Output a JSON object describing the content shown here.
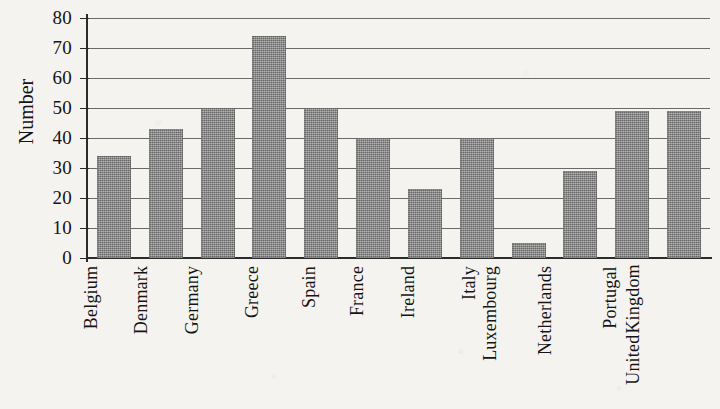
{
  "chart_data": {
    "type": "bar",
    "title": "",
    "xlabel": "",
    "ylabel": "Number",
    "ylim": [
      0,
      80
    ],
    "ytick_step": 10,
    "yticks": [
      80,
      70,
      60,
      50,
      40,
      30,
      20,
      10,
      0
    ],
    "grid": true,
    "legend": "none",
    "bar_color": "#808080",
    "axis_color": "#2b2b2b",
    "categories": [
      "Belgium",
      "Denmark",
      "Germany",
      "Greece",
      "Spain",
      "France",
      "Ireland",
      "Italy",
      "Luxembourg",
      "Netherlands",
      "Portugal",
      "United Kingdom"
    ],
    "category_lines": [
      [
        "Belgium"
      ],
      [
        "Denmark"
      ],
      [
        "Germany"
      ],
      [
        "Greece"
      ],
      [
        "Spain"
      ],
      [
        "France"
      ],
      [
        "Ireland"
      ],
      [
        "Italy"
      ],
      [
        "Luxembourg"
      ],
      [
        "Netherlands"
      ],
      [
        "Portugal"
      ],
      [
        "United",
        "Kingdom"
      ]
    ],
    "values": [
      34,
      43,
      50,
      74,
      50,
      40,
      23,
      40,
      5,
      29,
      49,
      49
    ]
  }
}
